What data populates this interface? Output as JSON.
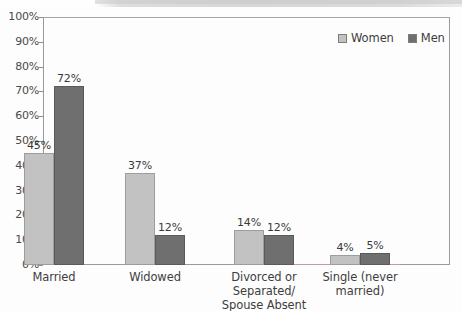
{
  "chart_data": {
    "type": "bar",
    "title": "",
    "subtitle": "",
    "xlabel": "",
    "ylabel": "",
    "ylim": [
      0,
      100
    ],
    "y_unit": "%",
    "grid": false,
    "legend_position": "top-right",
    "categories": [
      "Married",
      "Widowed",
      "Divorced or Separated/ Spouse Absent",
      "Single (never married)"
    ],
    "category_lines": [
      [
        "Married"
      ],
      [
        "Widowed"
      ],
      [
        "Divorced or",
        "Separated/",
        "Spouse Absent"
      ],
      [
        "Single (never",
        "married)"
      ]
    ],
    "series": [
      {
        "name": "Women",
        "color": "#c2c2c2",
        "values": [
          45,
          37,
          14,
          4
        ],
        "labels": [
          "45%",
          "37%",
          "14%",
          "4%"
        ]
      },
      {
        "name": "Men",
        "color": "#6f6f6f",
        "values": [
          72,
          12,
          12,
          5
        ],
        "labels": [
          "72%",
          "12%",
          "12%",
          "5%"
        ]
      }
    ],
    "y_ticks": [
      0,
      10,
      20,
      30,
      40,
      50,
      60,
      70,
      80,
      90,
      100
    ],
    "y_tick_labels": [
      "0%",
      "10%",
      "20%",
      "30%",
      "40%",
      "50%",
      "60%",
      "70%",
      "80%",
      "90%",
      "100%"
    ]
  },
  "legend": {
    "items": [
      {
        "label": "Women",
        "swatch": "women-swatch"
      },
      {
        "label": "Men",
        "swatch": "men-swatch"
      }
    ]
  },
  "colors": {
    "women": "#c2c2c2",
    "men": "#6f6f6f",
    "axis": "#9a9a9a",
    "text": "#3d3d3d",
    "background": "#fdfdfd"
  }
}
